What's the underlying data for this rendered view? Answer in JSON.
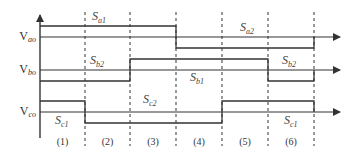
{
  "diagram": {
    "axis": {
      "x": 40,
      "y_top": 15,
      "y_bottom": 138,
      "x_end": 340
    },
    "boundaries_x": [
      40,
      85,
      130,
      176,
      222,
      268,
      314
    ],
    "periods": [
      "(1)",
      "(2)",
      "(3)",
      "(4)",
      "(5)",
      "(6)"
    ],
    "signals": [
      {
        "id": "vao",
        "label_main": "V",
        "label_sub": "ao",
        "baseline_y": 37,
        "high_y": 26,
        "low_y": 48,
        "levels": [
          "high",
          "high",
          "high",
          "low",
          "low",
          "low"
        ],
        "switch_labels": [
          {
            "text_main": "S",
            "text_sub": "a1",
            "x": 92,
            "y": 20
          },
          {
            "text_main": "S",
            "text_sub": "a2",
            "x": 240,
            "y": 31
          }
        ]
      },
      {
        "id": "vbo",
        "label_main": "V",
        "label_sub": "bo",
        "baseline_y": 70,
        "high_y": 59,
        "low_y": 81,
        "levels": [
          "low",
          "low",
          "high",
          "high",
          "high",
          "low"
        ],
        "switch_labels": [
          {
            "text_main": "S",
            "text_sub": "b2",
            "x": 90,
            "y": 64
          },
          {
            "text_main": "S",
            "text_sub": "b1",
            "x": 190,
            "y": 81
          },
          {
            "text_main": "S",
            "text_sub": "b2",
            "x": 282,
            "y": 64
          }
        ]
      },
      {
        "id": "vco",
        "label_main": "V",
        "label_sub": "co",
        "baseline_y": 112,
        "high_y": 101,
        "low_y": 123,
        "levels": [
          "high",
          "low",
          "low",
          "low",
          "high",
          "high"
        ],
        "switch_labels": [
          {
            "text_main": "S",
            "text_sub": "c1",
            "x": 55,
            "y": 124
          },
          {
            "text_main": "S",
            "text_sub": "c2",
            "x": 143,
            "y": 103
          },
          {
            "text_main": "S",
            "text_sub": "c1",
            "x": 284,
            "y": 124
          }
        ]
      }
    ],
    "colors": {
      "line": "#333333",
      "dash": "#555555"
    }
  }
}
